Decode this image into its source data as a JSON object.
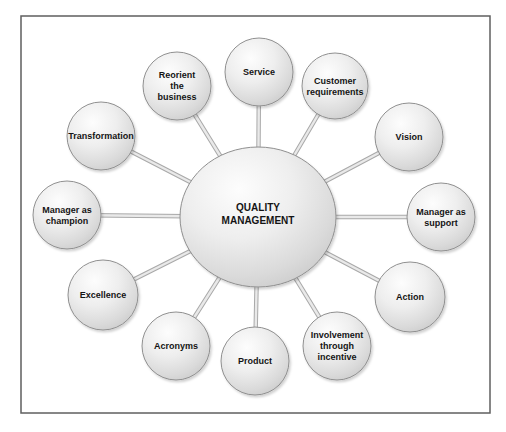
{
  "figure": {
    "background": "#ffffff",
    "frame": {
      "x": 21,
      "y": 16,
      "width": 469,
      "height": 397,
      "border_color": "#5f5f5f",
      "fill": "#ffffff"
    },
    "colors": {
      "sphere_highlight": "#fdfdfd",
      "sphere_mid": "#eeeeee",
      "sphere_edge": "#dadada",
      "sphere_rim": "#cbcbcb",
      "sphere_outline": "#8f8f8f",
      "connector_outer": "#a9a9a9",
      "connector_inner": "#e9e9e9",
      "text": "#141414"
    },
    "center": {
      "id": "quality-management",
      "lines": [
        "QUALITY",
        "MANAGEMENT"
      ],
      "cx": 258,
      "cy": 217,
      "rx": 78,
      "ry": 70,
      "font_size": 10,
      "line_height": 13
    },
    "nodes": [
      {
        "id": "service",
        "lines": [
          "Service"
        ],
        "cx": 259,
        "cy": 72,
        "r": 34
      },
      {
        "id": "customer-requirements",
        "lines": [
          "Customer",
          "requirements"
        ],
        "cx": 335,
        "cy": 86,
        "r": 33
      },
      {
        "id": "vision",
        "lines": [
          "Vision"
        ],
        "cx": 409,
        "cy": 137,
        "r": 34
      },
      {
        "id": "manager-as-support",
        "lines": [
          "Manager as",
          "support"
        ],
        "cx": 441,
        "cy": 217,
        "r": 34
      },
      {
        "id": "action",
        "lines": [
          "Action"
        ],
        "cx": 410,
        "cy": 297,
        "r": 35
      },
      {
        "id": "involvement-through-incentive",
        "lines": [
          "Involvement",
          "through",
          "incentive"
        ],
        "cx": 337,
        "cy": 346,
        "r": 34
      },
      {
        "id": "product",
        "lines": [
          "Product"
        ],
        "cx": 255,
        "cy": 361,
        "r": 34
      },
      {
        "id": "acronyms",
        "lines": [
          "Acronyms"
        ],
        "cx": 176,
        "cy": 346,
        "r": 34
      },
      {
        "id": "excellence",
        "lines": [
          "Excellence"
        ],
        "cx": 103,
        "cy": 295,
        "r": 35
      },
      {
        "id": "manager-as-champion",
        "lines": [
          "Manager as",
          "champion"
        ],
        "cx": 67,
        "cy": 215,
        "r": 34
      },
      {
        "id": "transformation",
        "lines": [
          "Transformation"
        ],
        "cx": 101,
        "cy": 136,
        "r": 34
      },
      {
        "id": "reorient-the-business",
        "lines": [
          "Reorient",
          "the",
          "business"
        ],
        "cx": 177,
        "cy": 86,
        "r": 34
      }
    ],
    "node_font_size": 9,
    "node_line_height": 11
  }
}
